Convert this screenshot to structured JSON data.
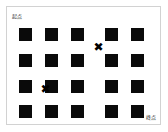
{
  "diagram": {
    "title_start_label": "起点",
    "title_end_label": "终点",
    "background_color": "#ffffff",
    "frame_color": "#d2d2d2",
    "cell_color": "#0a0a0a",
    "marker_color": "#000000",
    "marker_glyph": "✖",
    "grid": {
      "columns": 5,
      "rows": 4,
      "cell_size": 13,
      "pitch_x": 26,
      "pitch_y": 26,
      "origin_x": 19,
      "origin_y": 28
    },
    "cells": [
      {
        "row": 0,
        "col": 0,
        "x": 19,
        "y": 28
      },
      {
        "row": 0,
        "col": 1,
        "x": 45,
        "y": 28
      },
      {
        "row": 0,
        "col": 2,
        "x": 71,
        "y": 28
      },
      {
        "row": 0,
        "col": 3,
        "x": 105,
        "y": 28
      },
      {
        "row": 0,
        "col": 4,
        "x": 131,
        "y": 28
      },
      {
        "row": 1,
        "col": 0,
        "x": 19,
        "y": 54
      },
      {
        "row": 1,
        "col": 1,
        "x": 45,
        "y": 54
      },
      {
        "row": 1,
        "col": 2,
        "x": 71,
        "y": 54
      },
      {
        "row": 1,
        "col": 3,
        "x": 105,
        "y": 54
      },
      {
        "row": 1,
        "col": 4,
        "x": 131,
        "y": 54
      },
      {
        "row": 2,
        "col": 0,
        "x": 19,
        "y": 80
      },
      {
        "row": 2,
        "col": 1,
        "x": 45,
        "y": 80
      },
      {
        "row": 2,
        "col": 2,
        "x": 71,
        "y": 80
      },
      {
        "row": 2,
        "col": 3,
        "x": 105,
        "y": 80
      },
      {
        "row": 2,
        "col": 4,
        "x": 131,
        "y": 80
      },
      {
        "row": 3,
        "col": 0,
        "x": 19,
        "y": 105
      },
      {
        "row": 3,
        "col": 1,
        "x": 45,
        "y": 105
      },
      {
        "row": 3,
        "col": 2,
        "x": 71,
        "y": 105
      },
      {
        "row": 3,
        "col": 3,
        "x": 105,
        "y": 105
      },
      {
        "row": 3,
        "col": 4,
        "x": 131,
        "y": 105
      }
    ],
    "markers": [
      {
        "name": "marker-upper-right",
        "glyph": "✖",
        "x": 93,
        "y": 42
      },
      {
        "name": "marker-lower-left",
        "glyph": "✖",
        "x": 40,
        "y": 84
      }
    ]
  }
}
